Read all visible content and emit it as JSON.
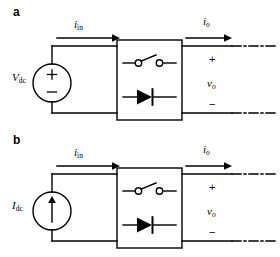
{
  "figure": {
    "title_visible": false,
    "background_color": "#ffffff",
    "line_color": "#000000",
    "width": 280,
    "height": 257
  },
  "panels": [
    {
      "id": "a",
      "label": "a",
      "source": {
        "kind": "dc-voltage-source",
        "symbol": "circle-with-plus-minus",
        "label_main": "V",
        "label_sub": "dc",
        "label_full": "Vdc",
        "terminal_top": "+",
        "terminal_bottom": "−"
      },
      "input_current": {
        "label_main": "i",
        "label_sub": "in",
        "label_full": "i_in",
        "direction": "right"
      },
      "output_current": {
        "label_main": "i",
        "label_sub": "o",
        "label_full": "i_o",
        "direction": "right"
      },
      "converter_box": {
        "switch": "open-switch",
        "diode": "diode-forward-right"
      },
      "output_port": {
        "plus": "+",
        "voltage_main": "v",
        "voltage_sub": "o",
        "voltage_full": "v_o",
        "minus": "−",
        "terminal_style": "dash-dot"
      }
    },
    {
      "id": "b",
      "label": "b",
      "source": {
        "kind": "dc-current-source",
        "symbol": "circle-with-up-arrow",
        "label_main": "I",
        "label_sub": "dc",
        "label_full": "Idc",
        "arrow_direction": "up"
      },
      "input_current": {
        "label_main": "i",
        "label_sub": "in",
        "label_full": "i_in",
        "direction": "right"
      },
      "output_current": {
        "label_main": "i",
        "label_sub": "o",
        "label_full": "i_o",
        "direction": "right"
      },
      "converter_box": {
        "switch": "open-switch",
        "diode": "diode-forward-right"
      },
      "output_port": {
        "plus": "+",
        "voltage_main": "v",
        "voltage_sub": "o",
        "voltage_full": "v_o",
        "minus": "−",
        "terminal_style": "dash-dot"
      }
    }
  ]
}
